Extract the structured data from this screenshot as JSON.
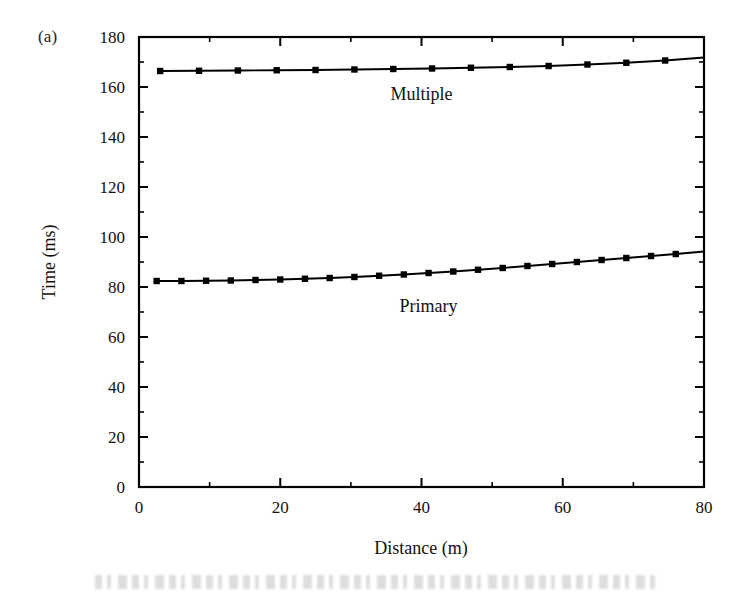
{
  "figure": {
    "panel_label": "(a)",
    "background_color": "#ffffff",
    "line_color": "#000000"
  },
  "chart_data": {
    "type": "line",
    "title": "",
    "subtitle": "",
    "xlabel": "Distance (m)",
    "ylabel": "Time (ms)",
    "xlim": [
      0,
      80
    ],
    "ylim": [
      0,
      180
    ],
    "x_major_ticks": [
      0,
      20,
      40,
      60,
      80
    ],
    "x_minor_step": 10,
    "y_major_ticks": [
      0,
      20,
      40,
      60,
      80,
      100,
      120,
      140,
      160,
      180
    ],
    "y_minor_step": 10,
    "x_tick_labels": [
      "0",
      "20",
      "40",
      "60",
      "80"
    ],
    "y_tick_labels": [
      "0",
      "20",
      "40",
      "60",
      "80",
      "100",
      "120",
      "140",
      "160",
      "180"
    ],
    "grid": false,
    "legend_position": "inline-annotation",
    "marker": "filled-square",
    "series": [
      {
        "name": "Multiple",
        "annotation": "Multiple",
        "annotation_x": 40,
        "annotation_y": 155,
        "marker": "filled-square",
        "color": "#000000",
        "x": [
          3.0,
          8.5,
          14.0,
          19.5,
          25.0,
          30.5,
          36.0,
          41.5,
          47.0,
          52.5,
          58.0,
          63.5,
          69.0,
          74.5,
          80.0
        ],
        "y": [
          166.4,
          166.5,
          166.6,
          166.7,
          166.8,
          167.0,
          167.2,
          167.4,
          167.7,
          168.0,
          168.4,
          169.0,
          169.7,
          170.6,
          171.8
        ]
      },
      {
        "name": "Primary",
        "annotation": "Primary",
        "annotation_x": 41,
        "annotation_y": 70,
        "marker": "filled-square",
        "color": "#000000",
        "x": [
          2.5,
          6.0,
          9.5,
          13.0,
          16.5,
          20.0,
          23.5,
          27.0,
          30.5,
          34.0,
          37.5,
          41.0,
          44.5,
          48.0,
          51.5,
          55.0,
          58.5,
          62.0,
          65.5,
          69.0,
          72.5,
          76.0,
          80.0
        ],
        "y": [
          82.4,
          82.4,
          82.5,
          82.6,
          82.8,
          83.0,
          83.3,
          83.6,
          84.0,
          84.5,
          85.0,
          85.6,
          86.2,
          86.9,
          87.6,
          88.4,
          89.2,
          90.0,
          90.8,
          91.6,
          92.4,
          93.2,
          94.2
        ]
      }
    ]
  },
  "plot_geometry": {
    "left": 139,
    "right": 704,
    "top": 37,
    "bottom": 487
  }
}
